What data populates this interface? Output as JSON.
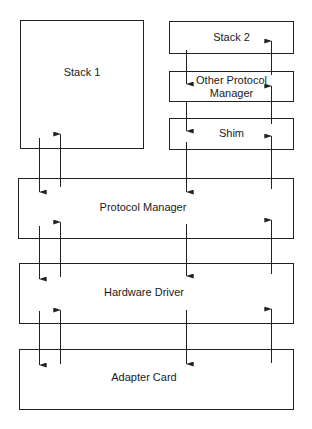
{
  "diagram": {
    "boxes": [
      {
        "id": "stack1",
        "label": "Stack 1"
      },
      {
        "id": "stack2",
        "label": "Stack 2"
      },
      {
        "id": "other_pm",
        "label": "Other Protocol\nManager"
      },
      {
        "id": "shim",
        "label": "Shim"
      },
      {
        "id": "protocol_manager",
        "label": "Protocol Manager"
      },
      {
        "id": "hardware_driver",
        "label": "Hardware Driver"
      },
      {
        "id": "adapter_card",
        "label": "Adapter Card"
      }
    ],
    "arrows": [
      {
        "from": "stack1",
        "to": "protocol_manager",
        "direction": "down"
      },
      {
        "from": "protocol_manager",
        "to": "stack1",
        "direction": "up"
      },
      {
        "from": "stack2",
        "to": "other_pm",
        "direction": "down"
      },
      {
        "from": "other_pm",
        "to": "stack2",
        "direction": "up"
      },
      {
        "from": "other_pm",
        "to": "shim",
        "direction": "down"
      },
      {
        "from": "shim",
        "to": "other_pm",
        "direction": "up"
      },
      {
        "from": "shim",
        "to": "protocol_manager",
        "direction": "down"
      },
      {
        "from": "protocol_manager",
        "to": "shim",
        "direction": "up"
      },
      {
        "from": "protocol_manager",
        "to": "hardware_driver",
        "direction": "down"
      },
      {
        "from": "hardware_driver",
        "to": "protocol_manager",
        "direction": "up"
      },
      {
        "from": "hardware_driver",
        "to": "adapter_card",
        "direction": "down"
      },
      {
        "from": "adapter_card",
        "to": "hardware_driver",
        "direction": "up"
      }
    ]
  }
}
